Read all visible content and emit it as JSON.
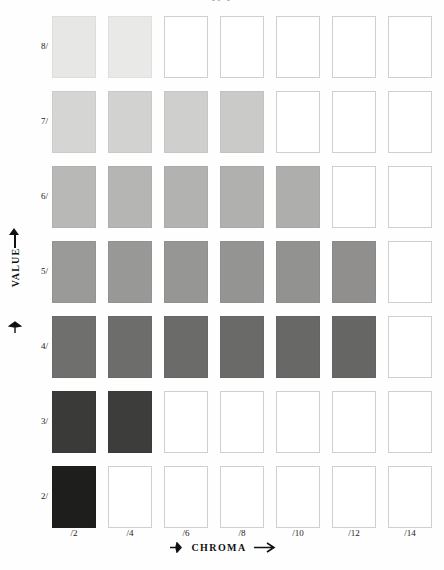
{
  "page": {
    "top_title": "10 Y",
    "background_color": "#fefefe"
  },
  "axes": {
    "value": {
      "title": "VALUE",
      "arrow": "up-arrow-icon",
      "labels": [
        "8/",
        "7/",
        "6/",
        "5/",
        "4/",
        "3/",
        "2/"
      ]
    },
    "chroma": {
      "title": "CHROMA",
      "arrow": "right-arrow-icon",
      "labels": [
        "/2",
        "/4",
        "/6",
        "/8",
        "/10",
        "/12",
        "/14"
      ]
    }
  },
  "chart_data": {
    "type": "heatmap",
    "title": "10 Y",
    "xlabel": "CHROMA",
    "ylabel": "VALUE",
    "grid": false,
    "legend": "none",
    "x": [
      "/2",
      "/4",
      "/6",
      "/8",
      "/10",
      "/12",
      "/14"
    ],
    "y": [
      "8/",
      "7/",
      "6/",
      "5/",
      "4/",
      "3/",
      "2/"
    ],
    "cells": [
      {
        "value": "8/",
        "colors": [
          "#e7e7e6",
          "#e9e9e8",
          null,
          null,
          null,
          null,
          null
        ]
      },
      {
        "value": "7/",
        "colors": [
          "#d5d5d4",
          "#d2d2d1",
          "#cfcfce",
          "#cacac9",
          null,
          null,
          null
        ]
      },
      {
        "value": "6/",
        "colors": [
          "#b8b8b7",
          "#b5b5b4",
          "#b2b2b1",
          "#b0b0af",
          "#aeaead",
          null,
          null
        ]
      },
      {
        "value": "5/",
        "colors": [
          "#9a9a99",
          "#989897",
          "#969695",
          "#949493",
          "#929291",
          "#908f8e",
          null
        ]
      },
      {
        "value": "4/",
        "colors": [
          "#6f6f6e",
          "#6d6d6c",
          "#6b6b6a",
          "#6a6a69",
          "#686867",
          "#666665",
          null
        ]
      },
      {
        "value": "3/",
        "colors": [
          "#3a3a39",
          "#3d3d3c",
          null,
          null,
          null,
          null,
          null
        ]
      },
      {
        "value": "2/",
        "colors": [
          "#1e1e1d",
          null,
          null,
          null,
          null,
          null,
          null
        ]
      }
    ],
    "empty_cell_color": "#ffffff",
    "cell_border_color": "#cfcfcf"
  }
}
